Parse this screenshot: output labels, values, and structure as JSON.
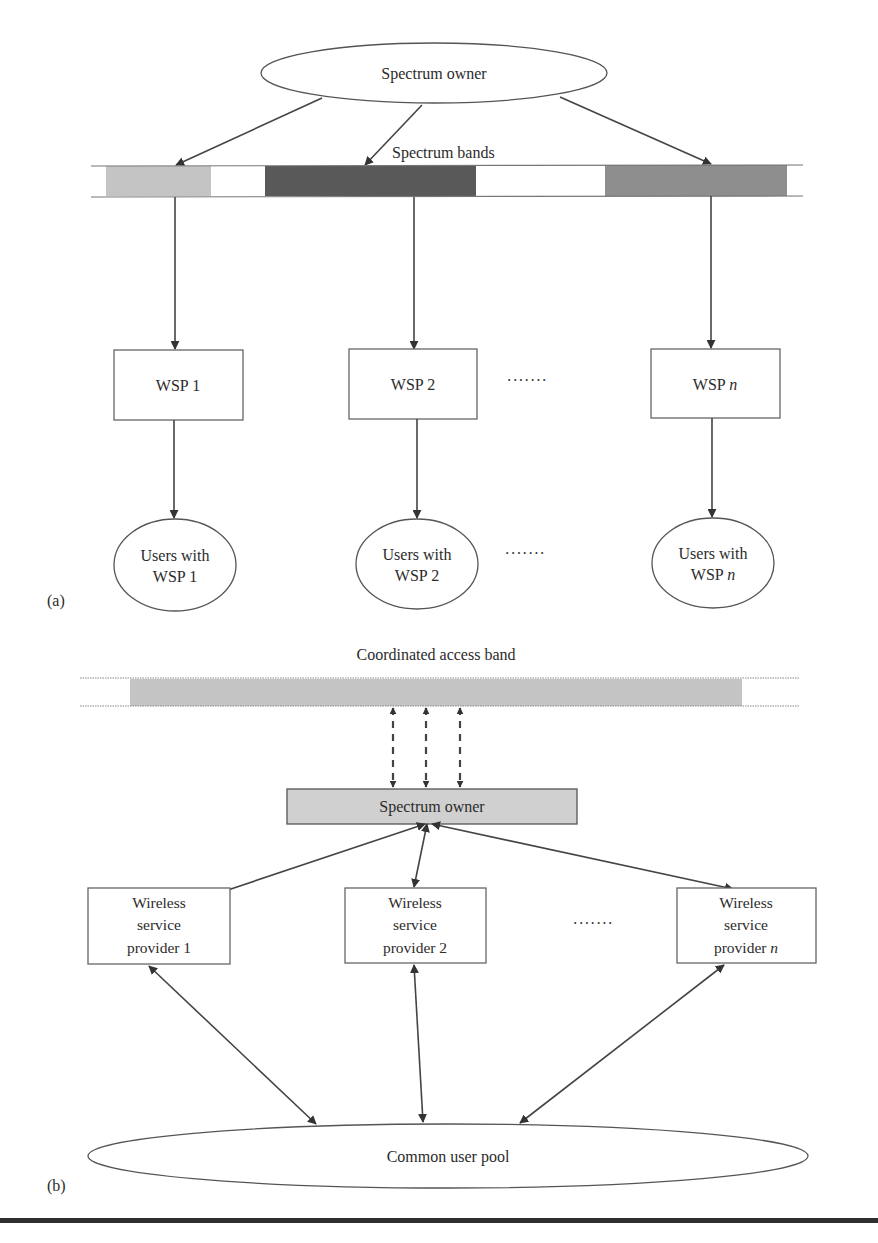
{
  "diagram_a": {
    "panel_label": "(a)",
    "owner": "Spectrum owner",
    "bands_label": "Spectrum bands",
    "band_colors": [
      "#c4c4c4",
      "#595959",
      "#8e8e8e"
    ],
    "providers": [
      {
        "prefix": "WSP ",
        "suffix": "1",
        "italic": false
      },
      {
        "prefix": "WSP ",
        "suffix": "2",
        "italic": false
      },
      {
        "prefix": "WSP ",
        "suffix": "n",
        "italic": true
      }
    ],
    "users": [
      {
        "line1": "Users with",
        "line2_prefix": "WSP ",
        "line2_suffix": "1"
      },
      {
        "line1": "Users with",
        "line2_prefix": "WSP ",
        "line2_suffix": "2"
      },
      {
        "line1": "Users with",
        "line2_prefix": "WSP ",
        "line2_suffix": "n"
      }
    ],
    "ellipsis": "·······"
  },
  "diagram_b": {
    "panel_label": "(b)",
    "band_label": "Coordinated access band",
    "band_color": "#c4c4c4",
    "owner": "Spectrum owner",
    "owner_fill": "#d0d0d0",
    "providers": [
      {
        "line1": "Wireless",
        "line2": "service",
        "line3_prefix": "provider ",
        "line3_suffix": "1"
      },
      {
        "line1": "Wireless",
        "line2": "service",
        "line3_prefix": "provider ",
        "line3_suffix": "2"
      },
      {
        "line1": "Wireless",
        "line2": "service",
        "line3_prefix": "provider ",
        "line3_suffix": "n"
      }
    ],
    "pool": "Common user pool",
    "ellipsis": "·······"
  }
}
